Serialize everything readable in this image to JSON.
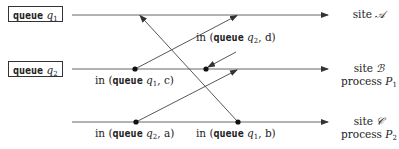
{
  "queues": [
    {
      "id": "q1",
      "prefix": "queue",
      "var": "q",
      "sub": "1"
    },
    {
      "id": "q2",
      "prefix": "queue",
      "var": "q",
      "sub": "2"
    }
  ],
  "sites": [
    {
      "id": "A",
      "line1_word": "site",
      "line1_var": "𝒜",
      "line2": ""
    },
    {
      "id": "B",
      "line1_word": "site",
      "line1_var": "ℬ",
      "line2_word": "process",
      "line2_var": "P",
      "line2_sub": "1"
    },
    {
      "id": "C",
      "line1_word": "site",
      "line1_var": "𝒞",
      "line2_word": "process",
      "line2_var": "P",
      "line2_sub": "2"
    }
  ],
  "events": [
    {
      "id": "c",
      "pre": "in (",
      "kw": "queue",
      "var": "q",
      "sub": "1",
      "post": ", c)"
    },
    {
      "id": "d",
      "pre": "in (",
      "kw": "queue",
      "var": "q",
      "sub": "2",
      "post": ", d)"
    },
    {
      "id": "a",
      "pre": "in (",
      "kw": "queue",
      "var": "q",
      "sub": "2",
      "post": ", a)"
    },
    {
      "id": "b",
      "pre": "in (",
      "kw": "queue",
      "var": "q",
      "sub": "1",
      "post": ", b)"
    }
  ],
  "colors": {
    "line": "#444444",
    "dot": "#111111"
  }
}
